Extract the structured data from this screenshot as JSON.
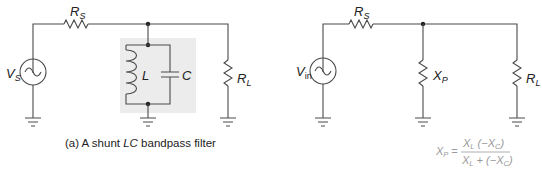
{
  "diagram_a": {
    "source_label": "V",
    "source_sub": "S",
    "series_resistor_label": "R",
    "series_resistor_sub": "S",
    "inductor_label": "L",
    "capacitor_label": "C",
    "load_label": "R",
    "load_sub": "L",
    "caption_prefix": "(a) A shunt ",
    "caption_italic": "LC",
    "caption_suffix": " bandpass filter",
    "tank_highlight_color": "#ececec"
  },
  "diagram_b": {
    "source_label": "V",
    "source_sub": "in",
    "series_resistor_label": "R",
    "series_resistor_sub": "S",
    "shunt_label": "X",
    "shunt_sub": "P",
    "load_label": "R",
    "load_sub": "L",
    "equation": {
      "lhs": "X",
      "lhs_sub": "P",
      "equals": "=",
      "num_a": "X",
      "num_a_sub": "L",
      "num_b": " (−X",
      "num_b_sub": "C",
      "num_c": ")",
      "den_a": "X",
      "den_a_sub": "L",
      "den_b": " + (−X",
      "den_b_sub": "C",
      "den_c": ")",
      "color": "#9a9a9a"
    }
  }
}
